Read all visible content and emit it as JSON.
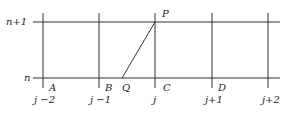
{
  "diagram": {
    "row_labels": {
      "top": "n+1",
      "bottom": "n"
    },
    "column_labels": [
      "j −2",
      "j −1",
      "j",
      "j+1",
      "j+2"
    ],
    "point_labels": {
      "A": "A",
      "B": "B",
      "C": "C",
      "D": "D",
      "P": "P",
      "Q": "Q"
    },
    "geometry": {
      "row_y": {
        "top": 22,
        "bottom": 78
      },
      "column_x": [
        43,
        99,
        155,
        212,
        268
      ],
      "h_line_x": [
        33,
        280
      ],
      "v_line_y": [
        13,
        88
      ],
      "Q": {
        "x": 122,
        "y": 78
      },
      "P": {
        "x": 155,
        "y": 22
      }
    }
  }
}
